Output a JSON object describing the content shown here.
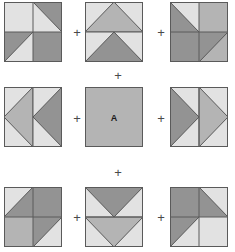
{
  "figure": {
    "title": "",
    "center_label": "A",
    "operator": "+",
    "colors": {
      "light": "#e2e2e2",
      "mid": "#b4b4b4",
      "dark": "#939393",
      "outline": "#5a5a5a",
      "operator_color": "#4a4a4a",
      "background": "#ffffff"
    },
    "grid": {
      "rows": 3,
      "cols": 3
    },
    "tiles": [
      {
        "id": "tile-1",
        "row": 0,
        "col": 0,
        "name": "top-left-tile",
        "description": "four quadrants: light square, light square with dark upper-right triangle, light square with dark lower-left triangle, dark square",
        "quadrants": [
          {
            "pos": "tl",
            "base": "light",
            "triangle": null
          },
          {
            "pos": "tr",
            "base": "light",
            "triangle": {
              "dir": "upper-right",
              "fill": "dark"
            }
          },
          {
            "pos": "bl",
            "base": "light",
            "triangle": {
              "dir": "lower-left",
              "fill": "dark"
            }
          },
          {
            "pos": "br",
            "base": "dark",
            "triangle": null
          }
        ]
      },
      {
        "id": "tile-2",
        "row": 0,
        "col": 1,
        "name": "top-center-tile",
        "description": "two horizontal bands, each containing an upward pointing triangle",
        "bands": [
          {
            "pos": "top",
            "base": "light",
            "triangle": {
              "dir": "up",
              "fill": "mid"
            }
          },
          {
            "pos": "bottom",
            "base": "light",
            "triangle": {
              "dir": "up",
              "fill": "dark"
            }
          }
        ]
      },
      {
        "id": "tile-3",
        "row": 0,
        "col": 2,
        "name": "top-right-tile",
        "description": "four quadrants: light with dark lower-left triangle, mid square, dark square, dark with light lower-right triangle",
        "quadrants": [
          {
            "pos": "tl",
            "base": "light",
            "triangle": {
              "dir": "lower-left",
              "fill": "dark"
            }
          },
          {
            "pos": "tr",
            "base": "mid",
            "triangle": null
          },
          {
            "pos": "bl",
            "base": "dark",
            "triangle": null
          },
          {
            "pos": "br",
            "base": "dark",
            "triangle": {
              "dir": "lower-right",
              "fill": "mid"
            }
          }
        ]
      },
      {
        "id": "tile-4",
        "row": 1,
        "col": 0,
        "name": "middle-left-tile",
        "description": "two vertical bands, each containing a left pointing triangle",
        "bands": [
          {
            "pos": "left",
            "base": "light",
            "triangle": {
              "dir": "left",
              "fill": "mid"
            }
          },
          {
            "pos": "right",
            "base": "light",
            "triangle": {
              "dir": "left",
              "fill": "dark"
            }
          }
        ]
      },
      {
        "id": "tile-5",
        "row": 1,
        "col": 1,
        "name": "center-tile",
        "description": "solid mid gray square labelled A",
        "solid": "mid",
        "label": "A"
      },
      {
        "id": "tile-6",
        "row": 1,
        "col": 2,
        "name": "middle-right-tile",
        "description": "two vertical bands, each containing a right pointing triangle",
        "bands": [
          {
            "pos": "left",
            "base": "light",
            "triangle": {
              "dir": "right",
              "fill": "dark"
            }
          },
          {
            "pos": "right",
            "base": "light",
            "triangle": {
              "dir": "right",
              "fill": "mid"
            }
          }
        ]
      },
      {
        "id": "tile-7",
        "row": 2,
        "col": 0,
        "name": "bottom-left-tile",
        "description": "four quadrants: light with dark upper-right triangle, dark square, mid square, light with dark upper-left triangle",
        "quadrants": [
          {
            "pos": "tl",
            "base": "light",
            "triangle": {
              "dir": "upper-right",
              "fill": "dark"
            }
          },
          {
            "pos": "tr",
            "base": "dark",
            "triangle": null
          },
          {
            "pos": "bl",
            "base": "mid",
            "triangle": null
          },
          {
            "pos": "br",
            "base": "light",
            "triangle": {
              "dir": "upper-left",
              "fill": "dark"
            }
          }
        ]
      },
      {
        "id": "tile-8",
        "row": 2,
        "col": 1,
        "name": "bottom-center-tile",
        "description": "two horizontal bands, each containing a downward pointing triangle",
        "bands": [
          {
            "pos": "top",
            "base": "light",
            "triangle": {
              "dir": "down",
              "fill": "dark"
            }
          },
          {
            "pos": "bottom",
            "base": "light",
            "triangle": {
              "dir": "down",
              "fill": "mid"
            }
          }
        ]
      },
      {
        "id": "tile-9",
        "row": 2,
        "col": 2,
        "name": "bottom-right-tile",
        "description": "four quadrants: dark square, light with dark upper-left triangle, light with dark upper-right triangle, light square",
        "quadrants": [
          {
            "pos": "tl",
            "base": "dark",
            "triangle": null
          },
          {
            "pos": "tr",
            "base": "light",
            "triangle": {
              "dir": "upper-left",
              "fill": "dark"
            }
          },
          {
            "pos": "bl",
            "base": "light",
            "triangle": {
              "dir": "upper-right",
              "fill": "dark"
            }
          },
          {
            "pos": "br",
            "base": "light",
            "triangle": null
          }
        ]
      }
    ],
    "operators": [
      {
        "id": "op-r0-c0",
        "name": "plus-row0-between-tile1-tile2",
        "symbol": "+",
        "x": 70,
        "y": 26
      },
      {
        "id": "op-r0-c1",
        "name": "plus-row0-between-tile2-tile3",
        "symbol": "+",
        "x": 154,
        "y": 26
      },
      {
        "id": "op-vert-top",
        "name": "plus-between-row0-row1",
        "symbol": "+",
        "x": 111,
        "y": 69
      },
      {
        "id": "op-r1-c0",
        "name": "plus-row1-between-tile4-tile5",
        "symbol": "+",
        "x": 70,
        "y": 112
      },
      {
        "id": "op-r1-c1",
        "name": "plus-row1-between-tile5-tile6",
        "symbol": "+",
        "x": 154,
        "y": 112
      },
      {
        "id": "op-vert-bottom",
        "name": "plus-between-row1-row2",
        "symbol": "+",
        "x": 111,
        "y": 166
      },
      {
        "id": "op-r2-c0",
        "name": "plus-row2-between-tile7-tile8",
        "symbol": "+",
        "x": 70,
        "y": 211
      },
      {
        "id": "op-r2-c1",
        "name": "plus-row2-between-tile8-tile9",
        "symbol": "+",
        "x": 154,
        "y": 211
      }
    ]
  }
}
